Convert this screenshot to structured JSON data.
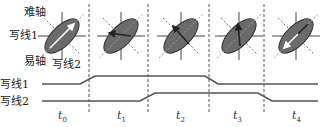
{
  "labels": {
    "hard_axis": "难轴",
    "easy_axis": "易轴",
    "write_line_1_top": "写线1",
    "write_line_2_top": "写线2",
    "write_line_1_wave": "写线1",
    "write_line_2_wave": "写线2"
  },
  "time_labels": [
    {
      "t": "t",
      "sub": "0"
    },
    {
      "t": "t",
      "sub": "1"
    },
    {
      "t": "t",
      "sub": "2"
    },
    {
      "t": "t",
      "sub": "3"
    },
    {
      "t": "t",
      "sub": "4"
    }
  ],
  "colors": {
    "ellipse_fill": "#6b6b6b",
    "ellipse_stroke": "#333333",
    "axis": "#444444",
    "dashed_axis": "#777777",
    "wave": "#555555",
    "divider": "#555555"
  },
  "cells": [
    {
      "cx": 62,
      "arrow": "up-right",
      "arrow_color": "#ffffff"
    },
    {
      "cx": 121,
      "arrow": "left-horizontal",
      "arrow_color": "#222222"
    },
    {
      "cx": 181,
      "arrow": "up-left",
      "arrow_color": "#222222"
    },
    {
      "cx": 239,
      "arrow": "up-vertical",
      "arrow_color": "#222222"
    },
    {
      "cx": 296,
      "arrow": "down-left",
      "arrow_color": "#ffffff"
    }
  ],
  "dividers_x": [
    89,
    148,
    209,
    264
  ],
  "waveforms": {
    "write_line_1": {
      "low_y": 84,
      "high_y": 76,
      "rise": [
        80,
        95
      ],
      "fall": [
        205,
        218
      ]
    },
    "write_line_2": {
      "low_y": 101,
      "high_y": 93,
      "rise": [
        140,
        155
      ],
      "fall": [
        258,
        272
      ]
    }
  }
}
